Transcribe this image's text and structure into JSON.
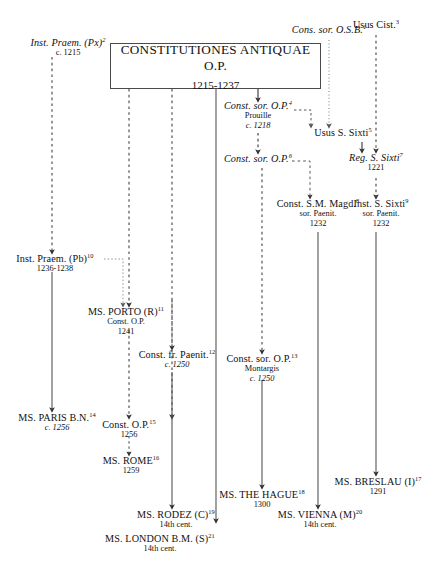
{
  "diagram": {
    "title_text": "Stemma of the Constitutiones Antiquae O.P.",
    "ink_color": "#111111",
    "line_color": "#555555",
    "box_border_color": "#4a4a4a",
    "background": "#ffffff"
  },
  "root": {
    "title": "CONSTITUTIONES ANTIQUAE O.P.",
    "date": "1215-1237"
  },
  "nodes": [
    {
      "id": "inst_praem_px",
      "title": "Inst. Praem. (Px)",
      "note": "2",
      "line2": "c. 1215",
      "line3": "",
      "style": "italic"
    },
    {
      "id": "cons_sor_osb",
      "title": "Cons. sor. O.S.B.",
      "note": "1",
      "line2": "",
      "line3": "",
      "style": "italic"
    },
    {
      "id": "usus_cist",
      "title": "Usus Cist.",
      "note": "3",
      "line2": "",
      "line3": "",
      "style": "roman"
    },
    {
      "id": "const_sor_op_prouille",
      "title": "Const. sor. O.P.",
      "note": "4",
      "line2": "Prouille",
      "line3": "c. 1218",
      "style": "italic"
    },
    {
      "id": "usus_s_sixti",
      "title": "Usus S. Sixti",
      "note": "5",
      "line2": "",
      "line3": "",
      "style": "roman"
    },
    {
      "id": "const_sor_op_6",
      "title": "Const. sor. O.P.",
      "note": "6",
      "line2": "",
      "line3": "",
      "style": "italic"
    },
    {
      "id": "reg_s_sixti",
      "title": "Reg. S. Sixti",
      "note": "7",
      "line2": "1221",
      "line3": "",
      "style": "italic"
    },
    {
      "id": "const_sm_magd",
      "title": "Const. S.M. Magd.",
      "note": "8",
      "line2": "sor. Paenit.",
      "line3": "1232",
      "style": "roman"
    },
    {
      "id": "inst_s_sixti",
      "title": "Inst. S. Sixti",
      "note": "9",
      "line2": "sor. Paenit.",
      "line3": "1232",
      "style": "roman"
    },
    {
      "id": "inst_praem_pb",
      "title": "Inst. Praem. (Pb)",
      "note": "10",
      "line2": "1236-1238",
      "line3": "",
      "style": "roman"
    },
    {
      "id": "ms_porto",
      "title": "MS. PORTO (R)",
      "note": "11",
      "line2": "Const. O.P.",
      "line3": "1241",
      "style": "roman"
    },
    {
      "id": "const_fr_paenit",
      "title": "Const. fr. Paenit.",
      "note": "12",
      "line2": "c. 1250",
      "line3": "",
      "style": "roman"
    },
    {
      "id": "const_sor_op_montargis",
      "title": "Const. sor. O.P.",
      "note": "13",
      "line2": "Montargis",
      "line3": "c. 1250",
      "style": "roman"
    },
    {
      "id": "ms_paris",
      "title": "MS. PARIS B.N.",
      "note": "14",
      "line2": "c. 1256",
      "line3": "",
      "style": "roman"
    },
    {
      "id": "const_op_15",
      "title": "Const. O.P.",
      "note": "15",
      "line2": "1256",
      "line3": "",
      "style": "roman"
    },
    {
      "id": "ms_rome",
      "title": "MS. ROME",
      "note": "16",
      "line2": "1259",
      "line3": "",
      "style": "roman"
    },
    {
      "id": "ms_breslau",
      "title": "MS. BRESLAU (I)",
      "note": "17",
      "line2": "1291",
      "line3": "",
      "style": "roman"
    },
    {
      "id": "ms_the_hague",
      "title": "MS. THE HAGUE",
      "note": "18",
      "line2": "1300",
      "line3": "",
      "style": "roman"
    },
    {
      "id": "ms_rodez",
      "title": "MS. RODEZ (C)",
      "note": "19",
      "line2": "14th cent.",
      "line3": "",
      "style": "roman"
    },
    {
      "id": "ms_vienna",
      "title": "MS. VIENNA (M)",
      "note": "20",
      "line2": "14th cent.",
      "line3": "",
      "style": "roman"
    },
    {
      "id": "ms_london",
      "title": "MS. LONDON B.M. (S)",
      "note": "21",
      "line2": "14th cent.",
      "line3": "",
      "style": "roman"
    }
  ]
}
